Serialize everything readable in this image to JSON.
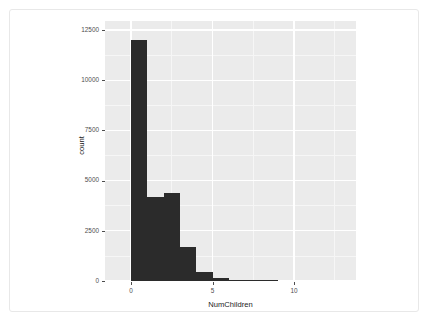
{
  "chart_data": {
    "type": "bar",
    "title": "",
    "subtitle": "",
    "xlabel": "NumChildren",
    "ylabel": "count",
    "xlim": [
      -1.6,
      13.8
    ],
    "ylim": [
      0,
      12950
    ],
    "grid": true,
    "legend": null,
    "binwidth": 1,
    "categories": [
      "0",
      "1",
      "2",
      "3",
      "4",
      "5",
      "6",
      "7",
      "8"
    ],
    "bin_edges": [
      0,
      1,
      2,
      3,
      4,
      5,
      6,
      7,
      8,
      9
    ],
    "values": [
      12000,
      4200,
      4400,
      1700,
      450,
      160,
      45,
      20,
      10
    ],
    "x_ticks": [
      {
        "value": 0,
        "label": "0"
      },
      {
        "value": 5,
        "label": "5"
      },
      {
        "value": 10,
        "label": "10"
      }
    ],
    "y_ticks": [
      {
        "value": 0,
        "label": "0"
      },
      {
        "value": 2500,
        "label": "2500"
      },
      {
        "value": 5000,
        "label": "5000"
      },
      {
        "value": 7500,
        "label": "7500"
      },
      {
        "value": 10000,
        "label": "10000"
      },
      {
        "value": 12500,
        "label": "12500"
      }
    ],
    "y_minor_ticks": [
      1250,
      3750,
      6250,
      8750,
      11250
    ],
    "x_minor_ticks": [
      -2.5,
      2.5,
      7.5,
      12.5
    ],
    "colors": {
      "bar": "#2b2b2b",
      "panel_background": "#ebebeb",
      "grid_major": "#ffffff",
      "grid_minor": "#f6f6f6",
      "axis_text": "#4d4d4d",
      "axis_title": "#1a1a1a",
      "figure_background": "#ffffff"
    }
  }
}
